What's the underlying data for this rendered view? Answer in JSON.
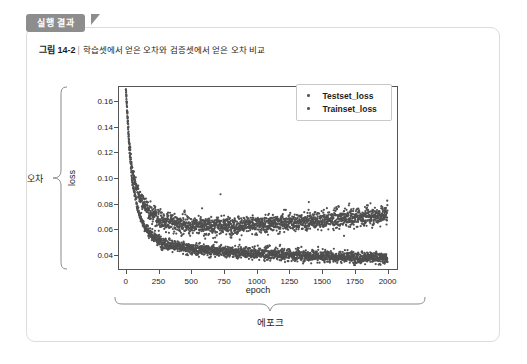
{
  "badge": {
    "label": "실행 결과"
  },
  "caption": {
    "number": "그림 14-2",
    "separator": "|",
    "text": "학습셋에서 얻은 오차와 검증셋에서 얻은 오차 비교"
  },
  "annotations": {
    "y_brace_label": "오차",
    "x_brace_label": "에포크"
  },
  "legend": {
    "items": [
      {
        "label": "Testset_loss",
        "color": "#5a5a5a"
      },
      {
        "label": "Trainset_loss",
        "color": "#5a5a5a"
      }
    ]
  },
  "chart_data": {
    "type": "scatter",
    "title": "",
    "xlabel": "epoch",
    "ylabel": "loss",
    "xlim": [
      -60,
      2080
    ],
    "ylim": [
      0.028,
      0.172
    ],
    "grid": false,
    "legend_position": "top-right",
    "xticks": [
      0,
      250,
      500,
      750,
      1000,
      1250,
      1500,
      1750,
      2000
    ],
    "xtick_labels": [
      "0",
      "250",
      "500",
      "750",
      "1000",
      "1250",
      "1500",
      "1750",
      "2000"
    ],
    "yticks": [
      0.04,
      0.06,
      0.08,
      0.1,
      0.12,
      0.14,
      0.16
    ],
    "ytick_labels": [
      "0.04",
      "0.06",
      "0.08",
      "0.10",
      "0.12",
      "0.14",
      "0.16"
    ],
    "marker": "point",
    "marker_size": 1.1,
    "series": [
      {
        "name": "Testset_loss",
        "color": "#4f4f4f",
        "description": "Validation loss: drops steeply from ~0.17 at epoch 0 to ~0.068 by epoch 250, flattens near 0.063 around epoch 600, then drifts slowly upward to ~0.072 by epoch 2000 with noisy scatter of about ±0.006.",
        "n_points": 2000,
        "epoch_samples": [
          0,
          25,
          50,
          100,
          150,
          200,
          250,
          300,
          400,
          500,
          600,
          750,
          1000,
          1250,
          1500,
          1750,
          2000
        ],
        "value_samples": [
          0.17,
          0.13,
          0.105,
          0.086,
          0.078,
          0.072,
          0.068,
          0.066,
          0.064,
          0.063,
          0.0625,
          0.0625,
          0.0635,
          0.065,
          0.067,
          0.069,
          0.0715
        ],
        "noise_band": 0.006
      },
      {
        "name": "Trainset_loss",
        "color": "#4f4f4f",
        "description": "Training loss: drops steeply from ~0.17 at epoch 0 to ~0.050 by epoch 250, continues decreasing slowly to ~0.037 by epoch 2000 with noisy scatter of about ±0.004.",
        "n_points": 2000,
        "epoch_samples": [
          0,
          25,
          50,
          100,
          150,
          200,
          250,
          300,
          400,
          500,
          600,
          750,
          1000,
          1250,
          1500,
          1750,
          2000
        ],
        "value_samples": [
          0.17,
          0.124,
          0.096,
          0.072,
          0.061,
          0.055,
          0.051,
          0.049,
          0.046,
          0.0445,
          0.0435,
          0.0425,
          0.041,
          0.0398,
          0.0388,
          0.038,
          0.0372
        ],
        "noise_band": 0.004
      }
    ]
  }
}
